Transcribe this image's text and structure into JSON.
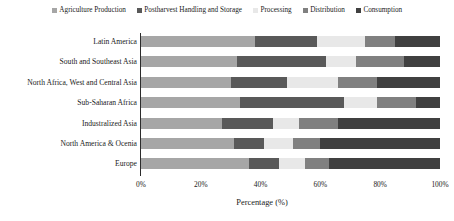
{
  "chart_data": {
    "type": "bar",
    "orientation": "horizontal",
    "stacked": true,
    "normalized": true,
    "title": "",
    "xlabel": "Percentage (%)",
    "ylabel": "",
    "xlim": [
      0,
      100
    ],
    "xticks": [
      "0%",
      "20%",
      "40%",
      "60%",
      "80%",
      "100%"
    ],
    "xtick_values": [
      0,
      20,
      40,
      60,
      80,
      100
    ],
    "grid": false,
    "legend_position": "top",
    "categories": [
      "Latin America",
      "South and Southeast Asia",
      "North Africa, West and Central Asia",
      "Sub-Saharan Africa",
      "Industralized Asia",
      "North America & Ocenia",
      "Europe"
    ],
    "series": [
      {
        "name": "Agriculture Production",
        "color": "#a6a6a6",
        "values": [
          38,
          32,
          30,
          33,
          27,
          31,
          36
        ]
      },
      {
        "name": "Postharvest Handling and Storage",
        "color": "#595959",
        "values": [
          21,
          30,
          19,
          35,
          17,
          10,
          10
        ]
      },
      {
        "name": "Processing",
        "color": "#e8e8e8",
        "values": [
          16,
          10,
          17,
          11,
          9,
          10,
          9
        ]
      },
      {
        "name": "Distribution",
        "color": "#808080",
        "values": [
          10,
          16,
          13,
          13,
          13,
          9,
          8
        ]
      },
      {
        "name": "Consumption",
        "color": "#404040",
        "values": [
          15,
          12,
          21,
          8,
          34,
          40,
          37
        ]
      }
    ]
  },
  "legend": {
    "items": [
      {
        "label": "Agriculture Production",
        "color": "#a6a6a6"
      },
      {
        "label": "Postharvest Handling and Storage",
        "color": "#595959"
      },
      {
        "label": "Processing",
        "color": "#e8e8e8"
      },
      {
        "label": "Distribution",
        "color": "#808080"
      },
      {
        "label": "Consumption",
        "color": "#404040"
      }
    ]
  }
}
